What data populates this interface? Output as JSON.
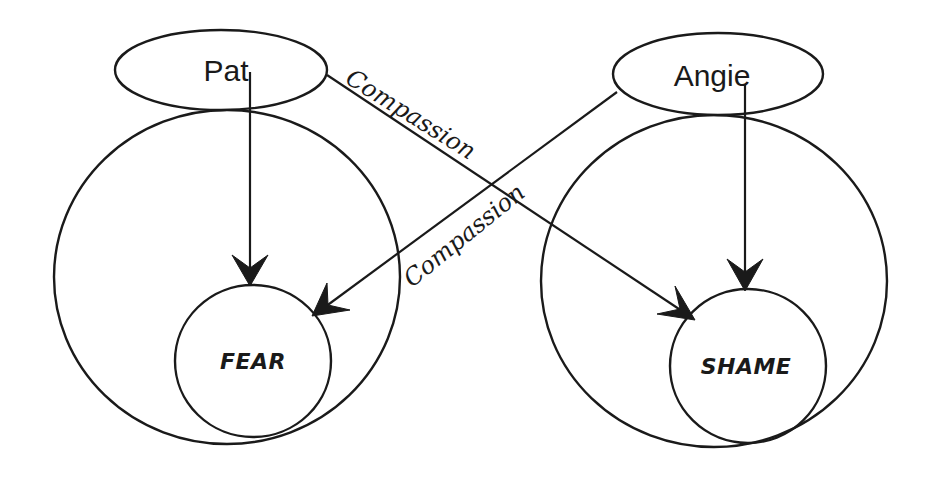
{
  "diagram": {
    "nodes": {
      "pat": {
        "label": "Pat"
      },
      "angie": {
        "label": "Angie"
      },
      "fear": {
        "label": "FEAR"
      },
      "shame": {
        "label": "SHAME"
      }
    },
    "edges": [
      {
        "from": "Pat",
        "to": "FEAR",
        "label": ""
      },
      {
        "from": "Pat",
        "to": "SHAME",
        "label": "Compassion"
      },
      {
        "from": "Angie",
        "to": "SHAME",
        "label": ""
      },
      {
        "from": "Angie",
        "to": "FEAR",
        "label": "Compassion"
      }
    ],
    "edge_labels": {
      "pat_to_shame": "Compassion",
      "angie_to_fear": "Compassion"
    },
    "colors": {
      "stroke": "#1a1a1a",
      "background": "#ffffff"
    }
  }
}
